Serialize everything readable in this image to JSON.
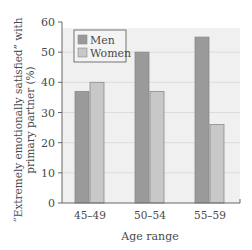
{
  "chart_data": {
    "type": "bar",
    "title": "",
    "xlabel": "Age range",
    "ylabel_line1": "“Extremely emotionally satisfied” with",
    "ylabel_line2": "primary partner (%)",
    "ylabel": "“Extremely emotionally satisfied” with primary partner (%)",
    "categories": [
      "45–49",
      "50–54",
      "55–59"
    ],
    "series": [
      {
        "name": "Men",
        "values": [
          37,
          50,
          55
        ],
        "color": "#9a9a9a"
      },
      {
        "name": "Women",
        "values": [
          40,
          37,
          26
        ],
        "color": "#c8c8c8"
      }
    ],
    "ylim": [
      0,
      60
    ],
    "yticks": [
      0,
      10,
      20,
      30,
      40,
      50,
      60
    ],
    "grid": true,
    "legend_position": "upper-left",
    "plot_background": "#f0f0f0",
    "grid_color": "#dcdcdc"
  }
}
